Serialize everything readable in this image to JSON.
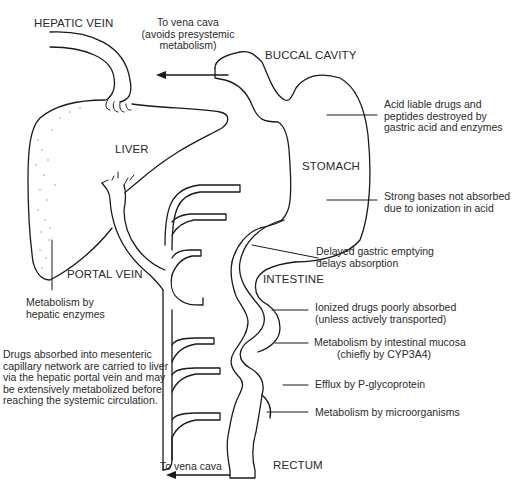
{
  "diagram": {
    "organs": {
      "hepatic_vein": "HEPATIC VEIN",
      "buccal_cavity": "BUCCAL CAVITY",
      "liver": "LIVER",
      "stomach": "STOMACH",
      "portal_vein": "PORTAL VEIN",
      "intestine": "INTESTINE",
      "rectum": "RECTUM"
    },
    "annotations": {
      "buccal_to_vena_cava": [
        "To vena cava",
        "(avoids presystemic",
        "metabolism)"
      ],
      "stomach_acid": [
        "Acid liable drugs and",
        "peptides destroyed by",
        "gastric acid and enzymes"
      ],
      "strong_bases": [
        "Strong bases not absorbed",
        "due to ionization in acid"
      ],
      "gastric_emptying": [
        "Delayed gastric emptying",
        "delays absorption"
      ],
      "ionized_drugs": [
        "Ionized drugs poorly  absorbed",
        "(unless actively transported)"
      ],
      "intestinal_mucosa": [
        "Metabolism by intestinal mucosa",
        "(chiefly by CYP3A4)"
      ],
      "efflux": "Efflux by P-glycoprotein",
      "microorganisms": "Metabolism by microorganisms",
      "rectum_to_vena_cava": "To vena cava",
      "hepatic_enzymes": [
        "Metabolism by",
        "hepatic enzymes"
      ],
      "portal_description": [
        "Drugs absorbed into mesenteric",
        "capillary network are carried to liver",
        "via the hepatic portal vein and may",
        "be extensively metabolized before",
        "reaching the systemic circulation."
      ]
    }
  }
}
